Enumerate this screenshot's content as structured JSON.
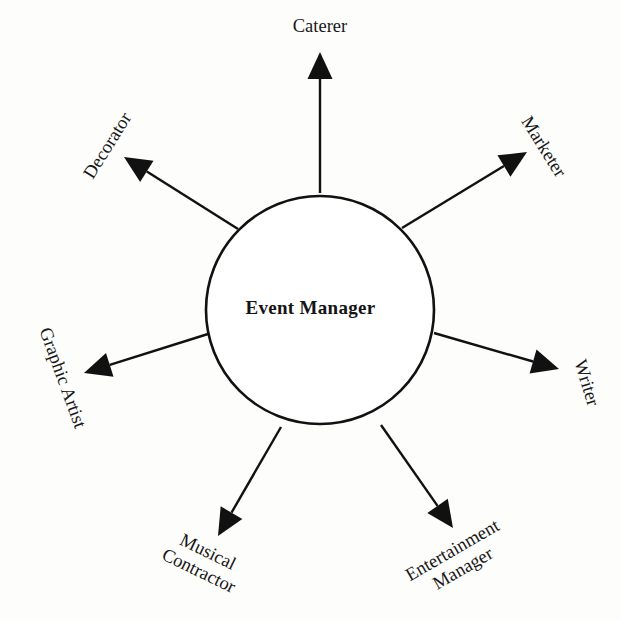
{
  "diagram": {
    "type": "radial-hub-and-spoke",
    "background_color": "#fdfdfb",
    "stroke_color": "#111111",
    "hub": {
      "label": "Event Manager",
      "shape": "circle",
      "center_x": 320,
      "center_y": 310,
      "radius": 114,
      "stroke_width": 2.6,
      "fill": "#ffffff",
      "text_color": "#141414"
    },
    "nodes": [
      {
        "id": "caterer",
        "label": "Caterer",
        "lines": [
          "Caterer"
        ],
        "angle_deg": -90,
        "rotation_deg": 0,
        "label_x": 320,
        "label_y": 27,
        "arrow": {
          "tip_x": 320,
          "tip_y": 52,
          "from_x": 320,
          "from_y": 193
        }
      },
      {
        "id": "marketer",
        "label": "Marketer",
        "lines": [
          "Marketer"
        ],
        "angle_deg": -45,
        "rotation_deg": 58,
        "label_x": 543,
        "label_y": 147,
        "arrow": {
          "tip_x": 527,
          "tip_y": 152,
          "from_x": 402,
          "from_y": 228
        }
      },
      {
        "id": "writer",
        "label": "Writer",
        "lines": [
          "Writer"
        ],
        "angle_deg": 20,
        "rotation_deg": 73,
        "label_x": 586,
        "label_y": 383,
        "arrow": {
          "tip_x": 559,
          "tip_y": 369,
          "from_x": 434,
          "from_y": 333
        }
      },
      {
        "id": "entertainment-manager",
        "label": "Entertainment Manager",
        "lines": [
          "Entertainment",
          "Manager"
        ],
        "angle_deg": 63,
        "rotation_deg": -30,
        "label_x": 458,
        "label_y": 560,
        "arrow": {
          "tip_x": 453,
          "tip_y": 528,
          "from_x": 381,
          "from_y": 425
        }
      },
      {
        "id": "musical-contractor",
        "label": "Musical Contractor",
        "lines": [
          "Musical",
          "Contractor"
        ],
        "angle_deg": 117,
        "rotation_deg": 26,
        "label_x": 203,
        "label_y": 562,
        "arrow": {
          "tip_x": 218,
          "tip_y": 536,
          "from_x": 281,
          "from_y": 427
        }
      },
      {
        "id": "graphic-artist",
        "label": "Graphic Artist",
        "lines": [
          "Graphic Artist"
        ],
        "angle_deg": 160,
        "rotation_deg": 70,
        "label_x": 62,
        "label_y": 378,
        "arrow": {
          "tip_x": 84,
          "tip_y": 373,
          "from_x": 208,
          "from_y": 334
        }
      },
      {
        "id": "decorator",
        "label": "Decorator",
        "lines": [
          "Decorator"
        ],
        "angle_deg": -135,
        "rotation_deg": -58,
        "label_x": 108,
        "label_y": 146,
        "arrow": {
          "tip_x": 124,
          "tip_y": 157,
          "from_x": 238,
          "from_y": 229
        }
      }
    ],
    "arrow_style": {
      "shaft_width": 2.4,
      "head_length": 27,
      "head_width": 25,
      "head_fill": "#111111"
    }
  }
}
